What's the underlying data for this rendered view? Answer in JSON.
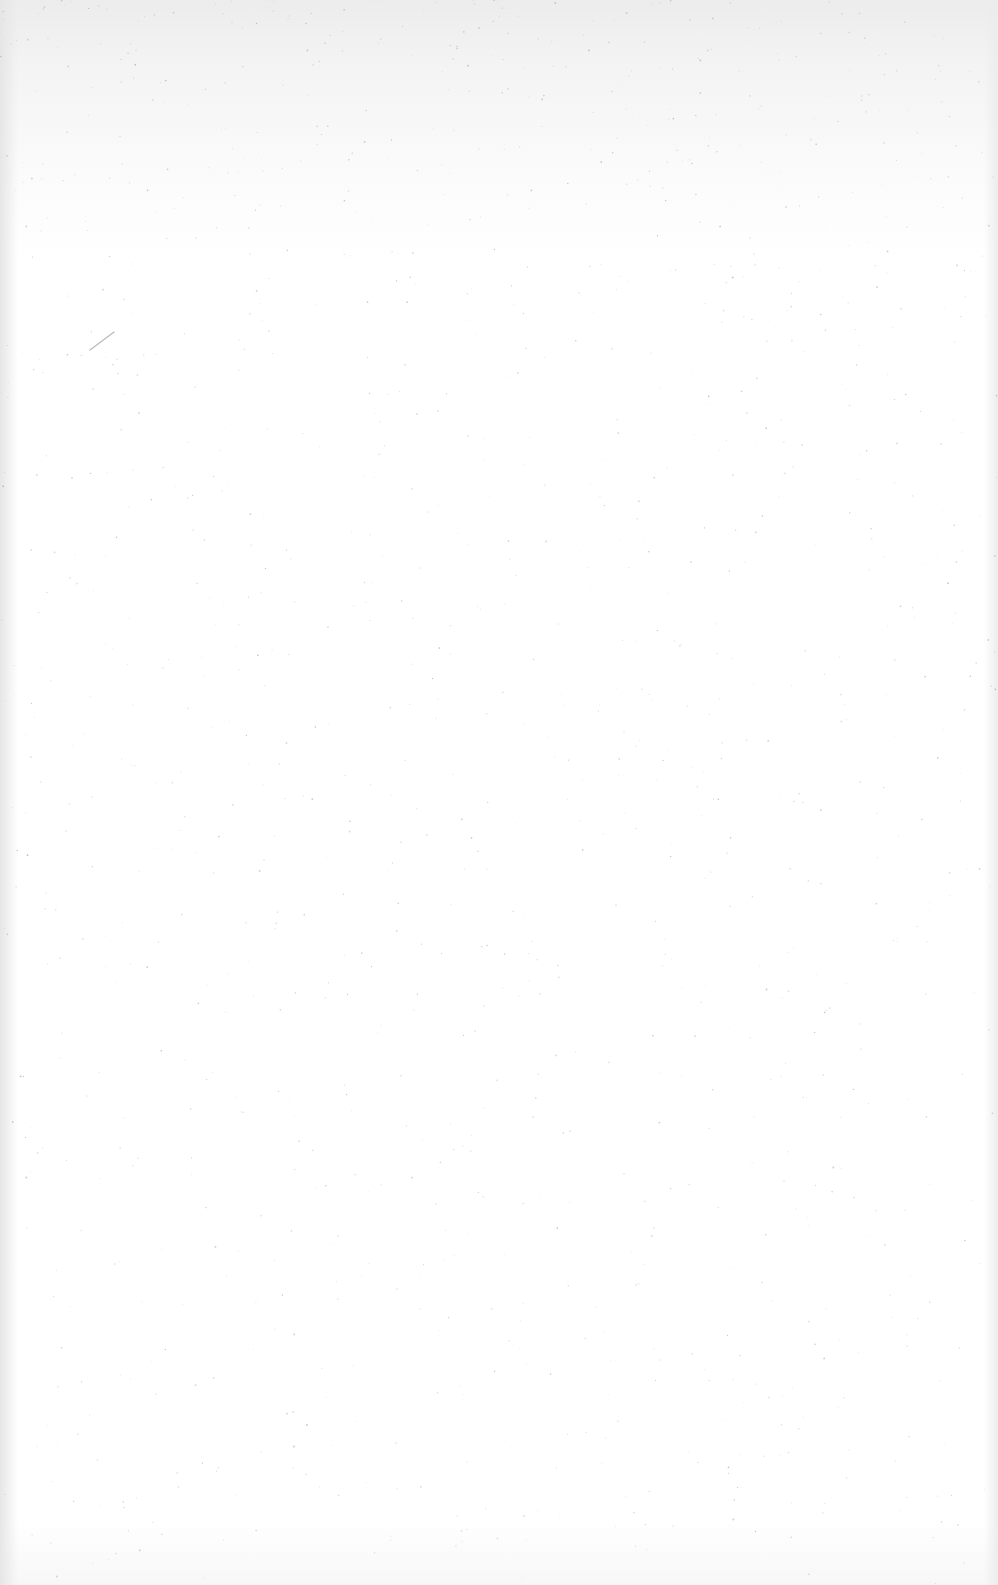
{
  "page": {
    "type": "blank scanned page",
    "text": "",
    "colors": {
      "paper": "#ffffff",
      "top_tint": "#ececec",
      "edge_shadow": "#e6e6e6",
      "speckle": "#9a9a9a",
      "pencil_mark": "#b8b8b8"
    }
  }
}
